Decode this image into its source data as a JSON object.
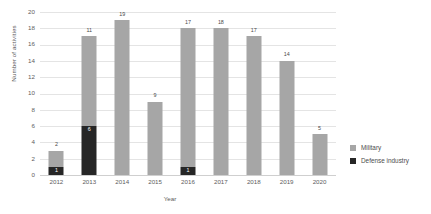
{
  "chart_data": {
    "type": "bar",
    "subtype": "stacked-column",
    "title": "",
    "xlabel": "Year",
    "ylabel": "Number of activities",
    "categories": [
      "2012",
      "2013",
      "2014",
      "2015",
      "2016",
      "2017",
      "2018",
      "2019",
      "2020"
    ],
    "ylim": [
      0,
      20
    ],
    "yticks": [
      0,
      2,
      4,
      6,
      8,
      10,
      12,
      14,
      16,
      18,
      20
    ],
    "ytick_labels": [
      "0",
      "2",
      "4",
      "6",
      "8",
      "10",
      "12",
      "14",
      "16",
      "18",
      "20"
    ],
    "grid": true,
    "legend_position": "right",
    "series": [
      {
        "name": "Military",
        "color": "#a6a6a6",
        "values": [
          2,
          11,
          19,
          9,
          17,
          18,
          17,
          14,
          5
        ],
        "labels": [
          "2",
          "11",
          "19",
          "9",
          "17",
          "18",
          "17",
          "14",
          "5"
        ]
      },
      {
        "name": "Defense industry",
        "color": "#262626",
        "values": [
          1,
          6,
          0,
          0,
          1,
          0,
          0,
          0,
          0
        ],
        "labels": [
          "1",
          "6",
          "",
          "",
          "1",
          "",
          "",
          "",
          ""
        ]
      }
    ],
    "totals": [
      3,
      17,
      19,
      9,
      18,
      18,
      17,
      14,
      5
    ]
  },
  "legend": {
    "items": [
      {
        "label": "Military",
        "color": "#a6a6a6",
        "icon": "square-swatch-icon"
      },
      {
        "label": "Defense industry",
        "color": "#262626",
        "icon": "square-swatch-icon"
      }
    ]
  }
}
